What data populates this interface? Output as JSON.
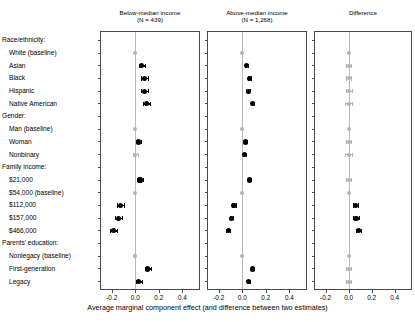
{
  "figure": {
    "axis_caption": "Average marginal component effect (and difference between two estimates)",
    "x_ticks": [
      "-0.2",
      "0.0",
      "0.2",
      "0.4"
    ],
    "x_tick_values": [
      -0.2,
      0.0,
      0.2,
      0.4
    ],
    "xlim": [
      -0.3,
      0.55
    ],
    "colors": {
      "estimate": "#000000",
      "baseline": "#b3b3b3",
      "zeroline": "#b9b9b9",
      "frame": "#4a4a4a",
      "background": "#ffffff"
    }
  },
  "row_labels": [
    "Race/ethnicity:",
    "White (baseline)",
    "Asian",
    "Black",
    "Hispanic",
    "Native American",
    "Gender:",
    "Man (baseline)",
    "Woman",
    "Nonbinary",
    "Family income:",
    "$21,000",
    "$54,000 (baseline)",
    "$112,000",
    "$157,000",
    "$466,000",
    "Parents' education:",
    "Nonlegacy (baseline)",
    "First-generation",
    "Legacy"
  ],
  "panels": [
    {
      "title": "Below-median income",
      "subtitle": "(N = 439)"
    },
    {
      "title": "Above-median income",
      "subtitle": "(N = 1,268)"
    },
    {
      "title": "Difference",
      "subtitle": ""
    }
  ],
  "chart_data": {
    "type": "scatter",
    "title": "",
    "xlabel": "Average marginal component effect (and difference between two estimates)",
    "ylabel": "",
    "xlim": [
      -0.3,
      0.55
    ],
    "x_ticks": [
      -0.2,
      0.0,
      0.2,
      0.4
    ],
    "grid": false,
    "legend": "none",
    "note": "Three-panel coefficient (forest) plot. Each panel shares the same category rows. Grey markers at zero are baseline/reference categories with no estimate; black markers are point estimates with 95% confidence intervals.",
    "categories": [
      "Race/ethnicity:",
      "White (baseline)",
      "Asian",
      "Black",
      "Hispanic",
      "Native American",
      "Gender:",
      "Man (baseline)",
      "Woman",
      "Nonbinary",
      "Family income:",
      "$21,000",
      "$54,000 (baseline)",
      "$112,000",
      "$157,000",
      "$466,000",
      "Parents' education:",
      "Nonlegacy (baseline)",
      "First-generation",
      "Legacy"
    ],
    "series": [
      {
        "name": "Below-median income (N = 439)",
        "points": [
          {
            "category": "Race/ethnicity:",
            "header": true
          },
          {
            "category": "White (baseline)",
            "estimate": 0.0,
            "low": 0.0,
            "high": 0.0,
            "baseline": true
          },
          {
            "category": "Asian",
            "estimate": 0.055,
            "low": 0.03,
            "high": 0.08
          },
          {
            "category": "Black",
            "estimate": 0.08,
            "low": 0.05,
            "high": 0.11
          },
          {
            "category": "Hispanic",
            "estimate": 0.075,
            "low": 0.05,
            "high": 0.105
          },
          {
            "category": "Native American",
            "estimate": 0.095,
            "low": 0.065,
            "high": 0.125
          },
          {
            "category": "Gender:",
            "header": true
          },
          {
            "category": "Man (baseline)",
            "estimate": 0.0,
            "low": 0.0,
            "high": 0.0,
            "baseline": true
          },
          {
            "category": "Woman",
            "estimate": 0.025,
            "low": 0.005,
            "high": 0.045
          },
          {
            "category": "Nonbinary",
            "estimate": 0.0,
            "low": -0.02,
            "high": 0.02,
            "baseline": true
          },
          {
            "category": "Family income:",
            "header": true
          },
          {
            "category": "$21,000",
            "estimate": 0.04,
            "low": 0.015,
            "high": 0.065
          },
          {
            "category": "$54,000 (baseline)",
            "estimate": 0.0,
            "low": 0.0,
            "high": 0.0,
            "baseline": true
          },
          {
            "category": "$112,000",
            "estimate": -0.125,
            "low": -0.155,
            "high": -0.095
          },
          {
            "category": "$157,000",
            "estimate": -0.14,
            "low": -0.17,
            "high": -0.11
          },
          {
            "category": "$466,000",
            "estimate": -0.185,
            "low": -0.215,
            "high": -0.155
          },
          {
            "category": "Parents' education:",
            "header": true
          },
          {
            "category": "Nonlegacy (baseline)",
            "estimate": 0.0,
            "low": 0.0,
            "high": 0.0,
            "baseline": true
          },
          {
            "category": "First-generation",
            "estimate": 0.105,
            "low": 0.08,
            "high": 0.13
          },
          {
            "category": "Legacy",
            "estimate": 0.03,
            "low": 0.005,
            "high": 0.055
          }
        ]
      },
      {
        "name": "Above-median income (N = 1,268)",
        "points": [
          {
            "category": "Race/ethnicity:",
            "header": true
          },
          {
            "category": "White (baseline)",
            "estimate": 0.0,
            "low": 0.0,
            "high": 0.0,
            "baseline": true
          },
          {
            "category": "Asian",
            "estimate": 0.035,
            "low": 0.02,
            "high": 0.05
          },
          {
            "category": "Black",
            "estimate": 0.06,
            "low": 0.045,
            "high": 0.075
          },
          {
            "category": "Hispanic",
            "estimate": 0.05,
            "low": 0.035,
            "high": 0.065
          },
          {
            "category": "Native American",
            "estimate": 0.085,
            "low": 0.07,
            "high": 0.1
          },
          {
            "category": "Gender:",
            "header": true
          },
          {
            "category": "Man (baseline)",
            "estimate": 0.0,
            "low": 0.0,
            "high": 0.0,
            "baseline": true
          },
          {
            "category": "Woman",
            "estimate": 0.03,
            "low": 0.018,
            "high": 0.042
          },
          {
            "category": "Nonbinary",
            "estimate": 0.02,
            "low": 0.008,
            "high": 0.032
          },
          {
            "category": "Family income:",
            "header": true
          },
          {
            "category": "$21,000",
            "estimate": 0.06,
            "low": 0.045,
            "high": 0.075
          },
          {
            "category": "$54,000 (baseline)",
            "estimate": 0.0,
            "low": 0.0,
            "high": 0.0,
            "baseline": true
          },
          {
            "category": "$112,000",
            "estimate": -0.07,
            "low": -0.085,
            "high": -0.055
          },
          {
            "category": "$157,000",
            "estimate": -0.09,
            "low": -0.105,
            "high": -0.075
          },
          {
            "category": "$466,000",
            "estimate": -0.12,
            "low": -0.135,
            "high": -0.105
          },
          {
            "category": "Parents' education:",
            "header": true
          },
          {
            "category": "Nonlegacy (baseline)",
            "estimate": 0.0,
            "low": 0.0,
            "high": 0.0,
            "baseline": true
          },
          {
            "category": "First-generation",
            "estimate": 0.085,
            "low": 0.072,
            "high": 0.098
          },
          {
            "category": "Legacy",
            "estimate": 0.05,
            "low": 0.037,
            "high": 0.063
          }
        ]
      },
      {
        "name": "Difference",
        "points": [
          {
            "category": "Race/ethnicity:",
            "header": true
          },
          {
            "category": "White (baseline)",
            "estimate": 0.0,
            "low": 0.0,
            "high": 0.0,
            "baseline": true
          },
          {
            "category": "Asian",
            "estimate": 0.0,
            "low": -0.022,
            "high": 0.022,
            "baseline": true
          },
          {
            "category": "Black",
            "estimate": 0.0,
            "low": -0.024,
            "high": 0.024,
            "baseline": true
          },
          {
            "category": "Hispanic",
            "estimate": 0.0,
            "low": -0.026,
            "high": 0.026,
            "baseline": true
          },
          {
            "category": "Native American",
            "estimate": 0.0,
            "low": -0.03,
            "high": 0.03,
            "baseline": true
          },
          {
            "category": "Gender:",
            "header": true
          },
          {
            "category": "Man (baseline)",
            "estimate": 0.0,
            "low": 0.0,
            "high": 0.0,
            "baseline": true
          },
          {
            "category": "Woman",
            "estimate": 0.0,
            "low": -0.02,
            "high": 0.02,
            "baseline": true
          },
          {
            "category": "Nonbinary",
            "estimate": 0.0,
            "low": -0.032,
            "high": 0.032,
            "baseline": true
          },
          {
            "category": "Family income:",
            "header": true
          },
          {
            "category": "$21,000",
            "estimate": 0.0,
            "low": -0.024,
            "high": 0.024,
            "baseline": true
          },
          {
            "category": "$54,000 (baseline)",
            "estimate": 0.0,
            "low": 0.0,
            "high": 0.0,
            "baseline": true
          },
          {
            "category": "$112,000",
            "estimate": 0.06,
            "low": 0.035,
            "high": 0.085
          },
          {
            "category": "$157,000",
            "estimate": 0.065,
            "low": 0.04,
            "high": 0.09
          },
          {
            "category": "$466,000",
            "estimate": 0.085,
            "low": 0.06,
            "high": 0.11
          },
          {
            "category": "Parents' education:",
            "header": true
          },
          {
            "category": "Nonlegacy (baseline)",
            "estimate": 0.0,
            "low": 0.0,
            "high": 0.0,
            "baseline": true
          },
          {
            "category": "First-generation",
            "estimate": 0.0,
            "low": -0.022,
            "high": 0.022,
            "baseline": true
          },
          {
            "category": "Legacy",
            "estimate": 0.0,
            "low": -0.024,
            "high": 0.024,
            "baseline": true
          }
        ]
      }
    ]
  }
}
